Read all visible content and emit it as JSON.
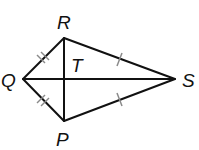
{
  "diagram": {
    "type": "kite",
    "vertices": [
      {
        "name": "R",
        "x": 64,
        "y": 38,
        "label_x": 57,
        "label_y": 29
      },
      {
        "name": "P",
        "x": 64,
        "y": 121,
        "label_x": 56,
        "label_y": 146
      },
      {
        "name": "Q",
        "x": 23,
        "y": 79,
        "label_x": 1,
        "label_y": 87
      },
      {
        "name": "S",
        "x": 175,
        "y": 79,
        "label_x": 182,
        "label_y": 87
      }
    ],
    "intersection": {
      "name": "T",
      "x": 64,
      "y": 79,
      "label_x": 71,
      "label_y": 72
    },
    "labels": {
      "R": "R",
      "P": "P",
      "Q": "Q",
      "S": "S",
      "T": "T"
    },
    "congruent_marks": [
      {
        "segments": [
          "QR",
          "QP"
        ],
        "ticks": 2
      },
      {
        "segments": [
          "RS",
          "PS"
        ],
        "ticks": 1
      }
    ],
    "colors": {
      "line": "#111111",
      "tick": "#8a8a8a",
      "label": "#111111"
    }
  }
}
